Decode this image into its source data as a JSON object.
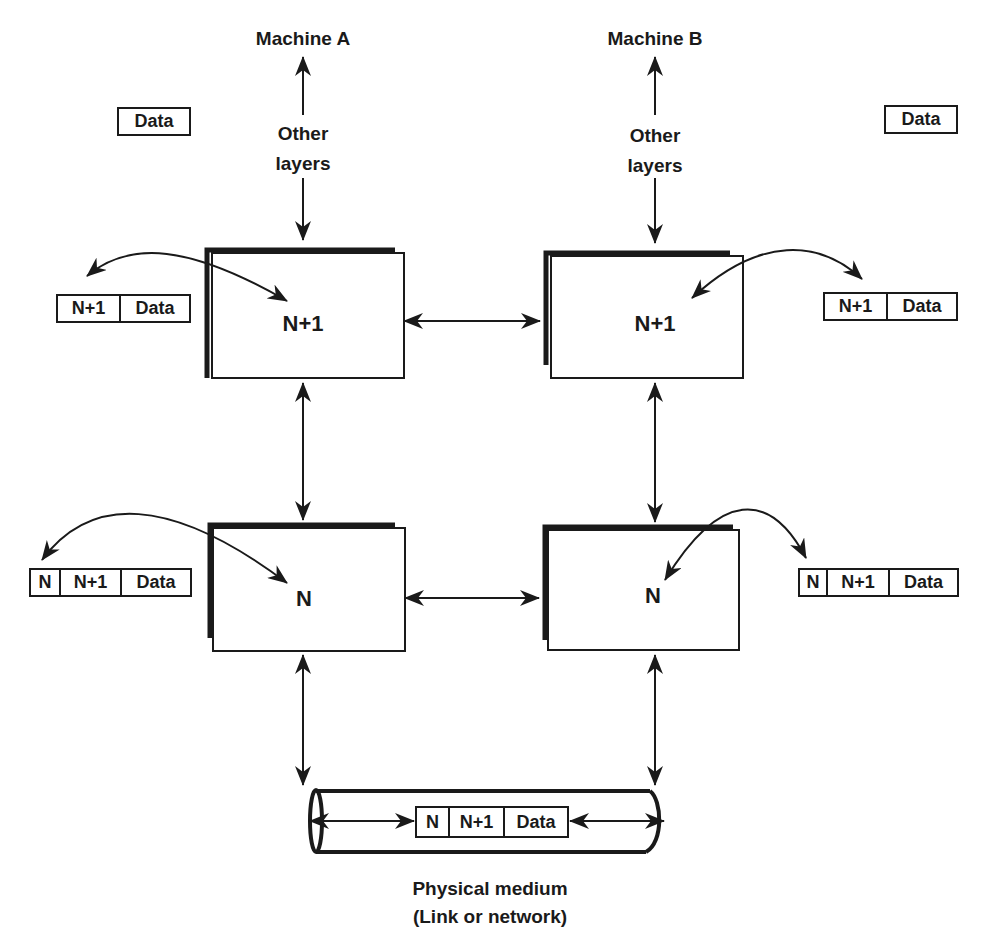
{
  "machines": {
    "a": {
      "title": "Machine A",
      "other_layers_line1": "Other",
      "other_layers_line2": "layers"
    },
    "b": {
      "title": "Machine B",
      "other_layers_line1": "Other",
      "other_layers_line2": "layers"
    }
  },
  "layers": {
    "a_upper": "N+1",
    "b_upper": "N+1",
    "a_lower": "N",
    "b_lower": "N"
  },
  "packets": {
    "a_top": [
      "Data"
    ],
    "b_top": [
      "Data"
    ],
    "a_upper": [
      "N+1",
      "Data"
    ],
    "b_upper": [
      "N+1",
      "Data"
    ],
    "a_lower": [
      "N",
      "N+1",
      "Data"
    ],
    "b_lower": [
      "N",
      "N+1",
      "Data"
    ],
    "medium": [
      "N",
      "N+1",
      "Data"
    ]
  },
  "medium": {
    "line1": "Physical medium",
    "line2": "(Link or network)"
  },
  "colors": {
    "ink": "#1a1a1a",
    "background": "#ffffff"
  }
}
